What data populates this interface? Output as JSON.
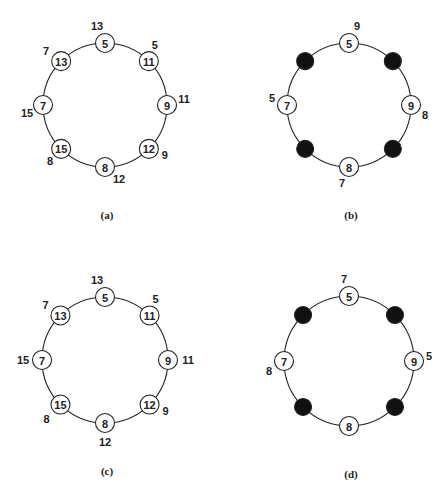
{
  "panels": [
    {
      "caption": "(a)",
      "center": [
        105,
        105
      ],
      "radius": 62,
      "nodes": [
        {
          "pos": 0,
          "label": "5",
          "filled": false,
          "outer": "13"
        },
        {
          "pos": 1,
          "label": "11",
          "filled": false,
          "outer": "5"
        },
        {
          "pos": 2,
          "label": "9",
          "filled": false,
          "outer": "11"
        },
        {
          "pos": 3,
          "label": "12",
          "filled": false,
          "outer": "9"
        },
        {
          "pos": 4,
          "label": "8",
          "filled": false,
          "outer": "12"
        },
        {
          "pos": 5,
          "label": "15",
          "filled": false,
          "outer": "8"
        },
        {
          "pos": 6,
          "label": "7",
          "filled": false,
          "outer": "15"
        },
        {
          "pos": 7,
          "label": "13",
          "filled": false,
          "outer": "7"
        }
      ]
    },
    {
      "caption": "(b)",
      "center": [
        349,
        105
      ],
      "radius": 62,
      "nodes": [
        {
          "pos": 0,
          "label": "5",
          "filled": false,
          "outer": "9"
        },
        {
          "pos": 1,
          "label": "",
          "filled": true,
          "outer": ""
        },
        {
          "pos": 2,
          "label": "9",
          "filled": false,
          "outer": "8"
        },
        {
          "pos": 3,
          "label": "",
          "filled": true,
          "outer": ""
        },
        {
          "pos": 4,
          "label": "8",
          "filled": false,
          "outer": "7"
        },
        {
          "pos": 5,
          "label": "",
          "filled": true,
          "outer": ""
        },
        {
          "pos": 6,
          "label": "7",
          "filled": false,
          "outer": "5"
        },
        {
          "pos": 7,
          "label": "",
          "filled": true,
          "outer": ""
        }
      ]
    },
    {
      "caption": "(c)",
      "center": [
        105,
        360
      ],
      "radius": 63,
      "nodes": [
        {
          "pos": 0,
          "label": "5",
          "filled": false,
          "outer": "13"
        },
        {
          "pos": 1,
          "label": "11",
          "filled": false,
          "outer": "5"
        },
        {
          "pos": 2,
          "label": "9",
          "filled": false,
          "outer": "11"
        },
        {
          "pos": 3,
          "label": "12",
          "filled": false,
          "outer": "9"
        },
        {
          "pos": 4,
          "label": "8",
          "filled": false,
          "outer": "12"
        },
        {
          "pos": 5,
          "label": "15",
          "filled": false,
          "outer": "8"
        },
        {
          "pos": 6,
          "label": "7",
          "filled": false,
          "outer": "15"
        },
        {
          "pos": 7,
          "label": "13",
          "filled": false,
          "outer": "7"
        }
      ]
    },
    {
      "caption": "(d)",
      "center": [
        349,
        361
      ],
      "radius": 65,
      "nodes": [
        {
          "pos": 0,
          "label": "5",
          "filled": false,
          "outer": "7"
        },
        {
          "pos": 1,
          "label": "",
          "filled": true,
          "outer": ""
        },
        {
          "pos": 2,
          "label": "9",
          "filled": false,
          "outer": "5"
        },
        {
          "pos": 3,
          "label": "",
          "filled": true,
          "outer": ""
        },
        {
          "pos": 4,
          "label": "8",
          "filled": false,
          "outer": ""
        },
        {
          "pos": 5,
          "label": "",
          "filled": true,
          "outer": ""
        },
        {
          "pos": 6,
          "label": "7",
          "filled": false,
          "outer": "8"
        },
        {
          "pos": 7,
          "label": "",
          "filled": true,
          "outer": ""
        }
      ]
    }
  ]
}
